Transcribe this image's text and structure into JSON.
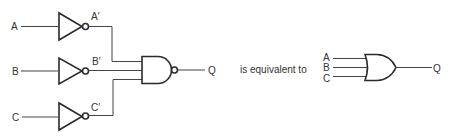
{
  "diagram": {
    "left_circuit": {
      "inputs": [
        {
          "label": "A",
          "inverted_label": "A′"
        },
        {
          "label": "B",
          "inverted_label": "B′"
        },
        {
          "label": "C",
          "inverted_label": "C′"
        }
      ],
      "gate": "NAND",
      "output_label": "Q"
    },
    "connector_text": "is equivalent to",
    "right_circuit": {
      "inputs": [
        "A",
        "B",
        "C"
      ],
      "gate": "OR",
      "output_label": "Q"
    },
    "colors": {
      "line": "#2a2a2a",
      "text": "#333333",
      "background": "#ffffff"
    }
  }
}
